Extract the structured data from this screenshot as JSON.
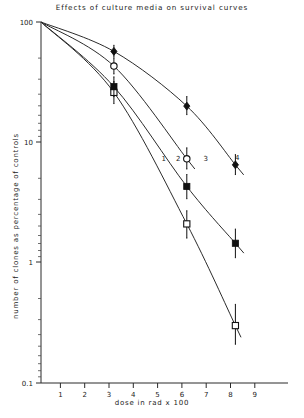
{
  "chart_data": {
    "type": "line",
    "title": "Effects of culture media on survival curves",
    "xlabel": "dose in rad x 100",
    "ylabel": "number of clones as percentage of controls",
    "yscale": "log",
    "xscale": "linear",
    "xlim": [
      0,
      9.6
    ],
    "ylim": [
      0.1,
      100
    ],
    "xticks": [
      1,
      2,
      3,
      4,
      5,
      6,
      7,
      8,
      9
    ],
    "xticklabels": [
      "1",
      "2",
      "3",
      "4",
      "5",
      "6",
      "7",
      "8",
      "9"
    ],
    "yticks": [
      0.1,
      1,
      10,
      100
    ],
    "yticklabels": [
      "0.1",
      "1",
      "10",
      "100"
    ],
    "grid": false,
    "legend": "inline-curve-numbers",
    "series": [
      {
        "name": "1",
        "label": "1",
        "marker": "open-square",
        "label_x": 5.05,
        "label_y": 7.0,
        "points": [
          {
            "x": 0.0,
            "y": 100
          },
          {
            "x": 3.0,
            "y": 26,
            "err_low": 21,
            "err_high": 32
          },
          {
            "x": 6.0,
            "y": 2.1,
            "err_low": 1.6,
            "err_high": 2.7
          },
          {
            "x": 8.0,
            "y": 0.3,
            "err_low": 0.21,
            "err_high": 0.45
          }
        ]
      },
      {
        "name": "2",
        "label": "2",
        "marker": "filled-square",
        "label_x": 5.65,
        "label_y": 7.0,
        "points": [
          {
            "x": 0.0,
            "y": 100
          },
          {
            "x": 3.0,
            "y": 29,
            "err_low": 24,
            "err_high": 35
          },
          {
            "x": 6.0,
            "y": 4.3,
            "err_low": 3.4,
            "err_high": 5.4
          },
          {
            "x": 8.0,
            "y": 1.45,
            "err_low": 1.1,
            "err_high": 1.9
          }
        ]
      },
      {
        "name": "3",
        "label": "3",
        "marker": "open-circle",
        "label_x": 6.78,
        "label_y": 7.0,
        "points": [
          {
            "x": 0.0,
            "y": 100
          },
          {
            "x": 3.0,
            "y": 43,
            "err_low": 37,
            "err_high": 50
          },
          {
            "x": 6.0,
            "y": 7.3,
            "err_low": 6.0,
            "err_high": 9.0
          }
        ]
      },
      {
        "name": "4",
        "label": "4",
        "marker": "filled-diamond",
        "label_x": 8.08,
        "label_y": 7.1,
        "points": [
          {
            "x": 0.0,
            "y": 100
          },
          {
            "x": 3.0,
            "y": 57,
            "err_low": 51,
            "err_high": 64
          },
          {
            "x": 6.0,
            "y": 20,
            "err_low": 17,
            "err_high": 24
          },
          {
            "x": 8.0,
            "y": 6.5,
            "err_low": 5.4,
            "err_high": 7.9
          }
        ]
      }
    ]
  },
  "axes": {
    "title": "Effects of culture media on survival curves",
    "x_label": "dose in rad x 100",
    "y_label": "number of clones as percentage of controls",
    "y_tick_100": "100",
    "y_tick_10": "10",
    "y_tick_1": "1",
    "y_tick_01": "0.1",
    "x_tick_1": "1",
    "x_tick_2": "2",
    "x_tick_3": "3",
    "x_tick_4": "4",
    "x_tick_5": "5",
    "x_tick_6": "6",
    "x_tick_7": "7",
    "x_tick_8": "8",
    "x_tick_9": "9"
  },
  "curve_labels": {
    "c1": "1",
    "c2": "2",
    "c3": "3",
    "c4": "4"
  }
}
